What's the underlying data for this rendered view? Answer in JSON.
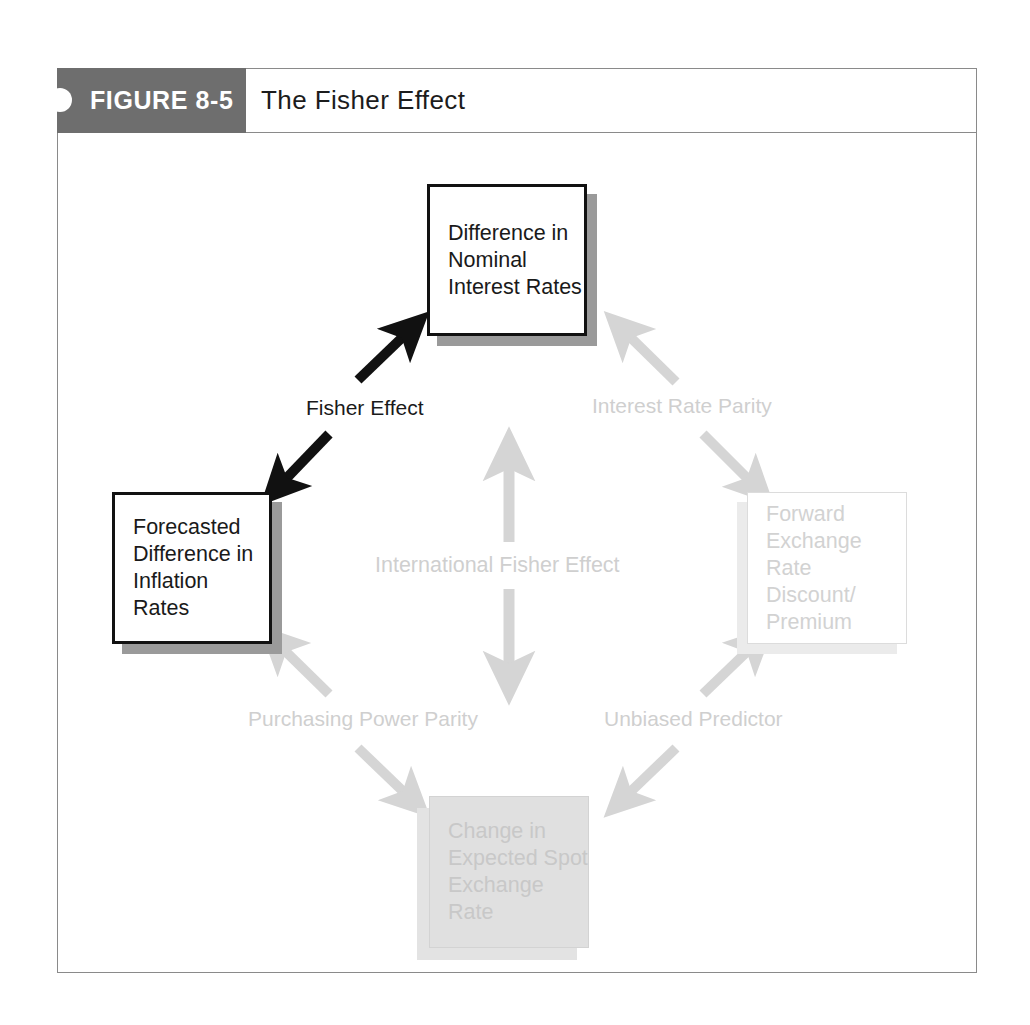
{
  "figure": {
    "number_label": "FIGURE 8-5",
    "title": "The Fisher Effect"
  },
  "diagram": {
    "type": "cycle-relationship-diagram",
    "nodes": [
      {
        "id": "nominal-rates",
        "position": "top",
        "label": "Difference in\nNominal\nInterest Rates",
        "style": "solid-dark",
        "border_color": "#111111",
        "fill_color": "#ffffff",
        "text_color": "#1a1a1a",
        "shadow_color": "#9a9a9a",
        "shadow_direction": "bottom-right"
      },
      {
        "id": "inflation-rates",
        "position": "left",
        "label": "Forecasted\nDifference in\nInflation Rates",
        "style": "solid-dark",
        "border_color": "#111111",
        "fill_color": "#ffffff",
        "text_color": "#1a1a1a",
        "shadow_color": "#9a9a9a",
        "shadow_direction": "bottom-right"
      },
      {
        "id": "forward-rate",
        "position": "right",
        "label": "Forward\nExchange Rate\nDiscount/\nPremium",
        "style": "faded",
        "border_color": "#dcdcdc",
        "fill_color": "#ffffff",
        "text_color": "#d2d2d2",
        "shadow_color": "#ebebeb",
        "shadow_direction": "bottom-left"
      },
      {
        "id": "spot-rate",
        "position": "bottom",
        "label": "Change in\nExpected Spot\nExchange Rate",
        "style": "faded-filled",
        "border_color": "#d3d3d3",
        "fill_color": "#e0e0e0",
        "text_color": "#c8c8c8",
        "shadow_color": "#e3e3e3",
        "shadow_direction": "bottom-left"
      }
    ],
    "edges": [
      {
        "id": "fisher-effect",
        "label": "Fisher Effect",
        "from": "inflation-rates",
        "to": "nominal-rates",
        "arrow": "double",
        "orientation": "diagonal-up-right",
        "color": "#111111",
        "emphasis": "highlighted"
      },
      {
        "id": "interest-rate-parity",
        "label": "Interest Rate Parity",
        "from": "nominal-rates",
        "to": "forward-rate",
        "arrow": "double",
        "orientation": "diagonal-down-right",
        "color": "#d5d5d5",
        "emphasis": "faded"
      },
      {
        "id": "purchasing-power-parity",
        "label": "Purchasing Power Parity",
        "from": "spot-rate",
        "to": "inflation-rates",
        "arrow": "double",
        "orientation": "diagonal-up-left",
        "color": "#d5d5d5",
        "emphasis": "faded"
      },
      {
        "id": "unbiased-predictor",
        "label": "Unbiased Predictor",
        "from": "spot-rate",
        "to": "forward-rate",
        "arrow": "double",
        "orientation": "diagonal-up-right",
        "color": "#d5d5d5",
        "emphasis": "faded"
      },
      {
        "id": "international-fisher-effect",
        "label": "International Fisher Effect",
        "from": "spot-rate",
        "to": "nominal-rates",
        "arrow": "double",
        "orientation": "vertical",
        "color": "#d5d5d5",
        "emphasis": "faded"
      }
    ],
    "colors": {
      "tab_gray": "#6e6e6e",
      "frame_gray": "#8a8a8a",
      "arrow_dark": "#111111",
      "arrow_faded": "#d5d5d5"
    }
  }
}
